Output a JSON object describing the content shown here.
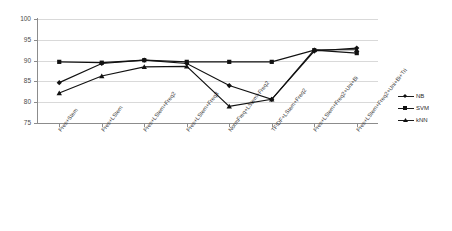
{
  "chart_data": {
    "type": "line",
    "title": "",
    "xlabel": "",
    "ylabel": "",
    "ylim": [
      75,
      100
    ],
    "ytick_step": 5,
    "yticks": [
      "100",
      "95",
      "90",
      "85",
      "80",
      "75"
    ],
    "grid": true,
    "legend_position": "right",
    "categories": [
      "Pres+Stem",
      "Pres+LStem",
      "Pres+LStem+Freq2",
      "Pres+LStem+Freq3",
      "NormFreq+LStem+Freq2",
      "TFIDF+LStem+Freq2",
      "Pres+LStem+Freq2+Uni+Bi",
      "Pres+LStem+Freq2+Uni+Bi+Tri"
    ],
    "series": [
      {
        "name": "NB",
        "marker": "diamond",
        "color": "#111111",
        "values": [
          84.7,
          89.3,
          90.1,
          89.3,
          84.0,
          80.7,
          92.3,
          93.0
        ]
      },
      {
        "name": "SVM",
        "marker": "square",
        "color": "#111111",
        "values": [
          89.7,
          89.5,
          90.1,
          89.7,
          89.7,
          89.7,
          92.5,
          91.8
        ]
      },
      {
        "name": "kNN",
        "marker": "triangle",
        "color": "#111111",
        "values": [
          82.2,
          86.3,
          88.5,
          88.6,
          79.0,
          80.7,
          92.6,
          92.6
        ]
      }
    ]
  },
  "legend": {
    "items": [
      {
        "label": "NB",
        "marker": "diamond"
      },
      {
        "label": "SVM",
        "marker": "square"
      },
      {
        "label": "kNN",
        "marker": "triangle"
      }
    ]
  }
}
